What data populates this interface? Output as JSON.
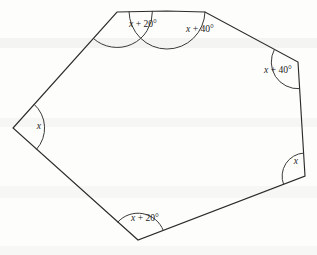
{
  "figure": {
    "shape_name": "heptagon",
    "sides": 7,
    "stroke_color": "#2b2b2b",
    "background_color": "#fdfdfc",
    "vertices": [
      {
        "id": "v-top-left",
        "x": 117,
        "y": 12
      },
      {
        "id": "v-top-middle",
        "x": 167,
        "y": 11
      },
      {
        "id": "v-top-right",
        "x": 205,
        "y": 12
      },
      {
        "id": "v-right-upper",
        "x": 298,
        "y": 62
      },
      {
        "id": "v-right-lower",
        "x": 305,
        "y": 176
      },
      {
        "id": "v-bottom",
        "x": 138,
        "y": 240
      },
      {
        "id": "v-left",
        "x": 13,
        "y": 128
      }
    ],
    "angles": [
      {
        "id": "angle-top-left",
        "vertex": "v-top-left",
        "variable": "x",
        "operator": "+",
        "offset": "20°",
        "label": "x + 20°",
        "label_x": 143,
        "label_y": 25
      },
      {
        "id": "angle-top-middle",
        "vertex": "v-top-middle",
        "variable": "x",
        "operator": "+",
        "offset": "40°",
        "label": "x + 40°",
        "label_x": 200,
        "label_y": 30
      },
      {
        "id": "angle-right-upper",
        "vertex": "v-right-upper",
        "variable": "x",
        "operator": "+",
        "offset": "40°",
        "label": "x + 40°",
        "label_x": 278,
        "label_y": 71
      },
      {
        "id": "angle-right-lower",
        "vertex": "v-right-lower",
        "variable": "x",
        "operator": "",
        "offset": "",
        "label": "x",
        "label_x": 296,
        "label_y": 162
      },
      {
        "id": "angle-bottom",
        "vertex": "v-bottom",
        "variable": "x",
        "operator": "+",
        "offset": "20°",
        "label": "x + 20°",
        "label_x": 145,
        "label_y": 219
      },
      {
        "id": "angle-left",
        "vertex": "v-left",
        "variable": "x",
        "operator": "",
        "offset": "",
        "label": "x",
        "label_x": 39,
        "label_y": 127
      }
    ]
  },
  "chart_data": {
    "type": "diagram",
    "labels": [
      "x + 20°",
      "x + 40°",
      "x + 40°",
      "x",
      "x + 20°",
      "x"
    ],
    "unlabelled_vertices": 1
  }
}
